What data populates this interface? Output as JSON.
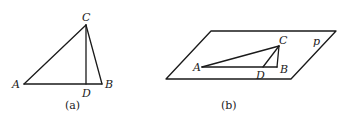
{
  "figures": [
    {
      "id": "a",
      "caption": "(a)",
      "points": {
        "A": {
          "label": "A",
          "x": 24,
          "y": 84
        },
        "B": {
          "label": "B",
          "x": 102,
          "y": 84
        },
        "C": {
          "label": "C",
          "x": 86,
          "y": 25
        },
        "D": {
          "label": "D",
          "x": 86,
          "y": 84
        }
      },
      "segments": [
        "AB",
        "AC",
        "BC",
        "CD"
      ]
    },
    {
      "id": "b",
      "caption": "(b)",
      "plane_label": "p",
      "plane": [
        [
          166,
          79
        ],
        [
          211,
          31
        ],
        [
          336,
          31
        ],
        [
          291,
          79
        ]
      ],
      "points": {
        "A": {
          "label": "A",
          "x": 202,
          "y": 67
        },
        "B": {
          "label": "B",
          "x": 277,
          "y": 67
        },
        "C": {
          "label": "C",
          "x": 279,
          "y": 46
        },
        "D": {
          "label": "D",
          "x": 263,
          "y": 67
        }
      },
      "segments": [
        "AB",
        "AC",
        "BC",
        "CD"
      ]
    }
  ]
}
